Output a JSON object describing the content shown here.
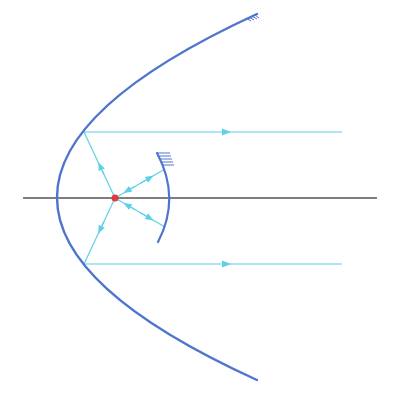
{
  "diagram": {
    "title": "",
    "colors": {
      "background": "#ffffff",
      "mirror": "#4f74cf",
      "ray": "#5fd0ea",
      "axis": "#555555",
      "focus": "#e0393e"
    },
    "axis": {
      "x1": 23,
      "y1": 198,
      "x2": 377,
      "y2": 198
    },
    "focus": {
      "cx": 115,
      "cy": 198,
      "r": 3.5
    },
    "parabola": {
      "vertex_x": 57,
      "vertex_y": 198,
      "top": [
        257,
        14
      ],
      "bottom": [
        257,
        380
      ]
    },
    "secondary_mirror": {
      "top": [
        157,
        153
      ],
      "mid": [
        169,
        198
      ],
      "bottom": [
        158,
        242
      ]
    },
    "rays": [
      {
        "name": "upper-parallel-ray",
        "from": [
          84,
          132
        ],
        "to": [
          342,
          132
        ],
        "arrow_at": [
          228,
          132
        ],
        "direction": "right"
      },
      {
        "name": "lower-parallel-ray",
        "from": [
          84,
          264
        ],
        "to": [
          342,
          264
        ],
        "arrow_at": [
          228,
          264
        ],
        "direction": "right"
      },
      {
        "name": "upper-focus-ray",
        "from": [
          115,
          198
        ],
        "to": [
          84,
          132
        ],
        "arrow_at": [
          100,
          166
        ],
        "direction": "up"
      },
      {
        "name": "lower-focus-ray",
        "from": [
          115,
          198
        ],
        "to": [
          84,
          264
        ],
        "arrow_at": [
          100,
          230
        ],
        "direction": "down"
      },
      {
        "name": "upper-secondary-ray",
        "from": [
          115,
          198
        ],
        "to": [
          165,
          169
        ]
      },
      {
        "name": "lower-secondary-ray",
        "from": [
          115,
          198
        ],
        "to": [
          165,
          227
        ]
      }
    ]
  }
}
